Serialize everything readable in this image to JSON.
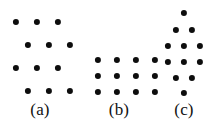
{
  "figure": {
    "caption_style": "parenthesized-lower-alpha",
    "background_color": "#ffffff",
    "dot_color": "#0d0d0d",
    "label_color": "#111111",
    "panels": [
      {
        "id": "a",
        "label": "(a)",
        "label_x": 40,
        "label_y": 101,
        "description": "oblique lattice, 4 rows of 3 dots with alternate rows shifted right",
        "dot_radius": 3.1,
        "rows": [
          {
            "y": 22,
            "x": [
              16,
              37,
              58
            ]
          },
          {
            "y": 45,
            "x": [
              28,
              49,
              70
            ]
          },
          {
            "y": 68,
            "x": [
              16,
              37,
              58
            ]
          },
          {
            "y": 91,
            "x": [
              28,
              49,
              70
            ]
          }
        ]
      },
      {
        "id": "b",
        "label": "(b)",
        "label_x": 119,
        "label_y": 101,
        "description": "rectangular lattice, 3 rows of 4 dots",
        "dot_radius": 3.1,
        "rows": [
          {
            "y": 60,
            "x": [
              98,
              117,
              136,
              155
            ]
          },
          {
            "y": 76,
            "x": [
              98,
              117,
              136,
              155
            ]
          },
          {
            "y": 92,
            "x": [
              98,
              117,
              136,
              155
            ]
          }
        ]
      },
      {
        "id": "c",
        "label": "(c)",
        "label_x": 184,
        "label_y": 101,
        "description": "hexagonal diamond cluster, rows of 1, 2, 3, 3, 2, 1 dots",
        "dot_radius": 3.1,
        "rows": [
          {
            "y": 13,
            "x": [
              184
            ]
          },
          {
            "y": 30,
            "x": [
              176,
              192
            ]
          },
          {
            "y": 46,
            "x": [
              168,
              184,
              200
            ]
          },
          {
            "y": 62,
            "x": [
              168,
              184,
              200
            ]
          },
          {
            "y": 78,
            "x": [
              176,
              192
            ]
          },
          {
            "y": 93,
            "x": [
              184
            ]
          }
        ]
      }
    ]
  }
}
